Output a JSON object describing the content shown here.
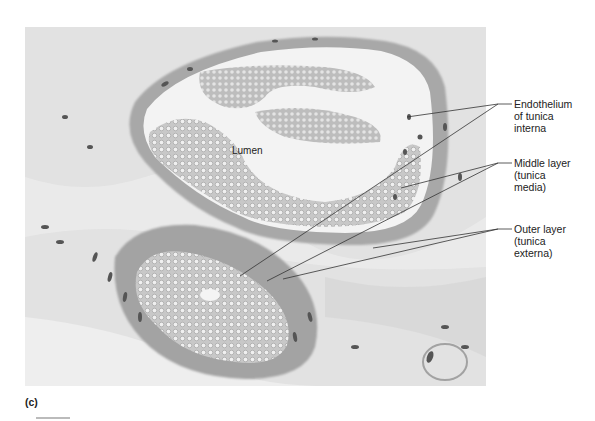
{
  "figure": {
    "panel_letter": "(c)",
    "lumen_label": "Lumen",
    "labels": [
      {
        "id": "endothelium",
        "lines": [
          "Endothelium",
          "of tunica",
          "interna"
        ]
      },
      {
        "id": "middle-layer",
        "lines": [
          "Middle layer",
          "(tunica",
          "media)"
        ]
      },
      {
        "id": "outer-layer",
        "lines": [
          "Outer layer",
          "(tunica",
          "externa)"
        ]
      }
    ],
    "colors": {
      "tissue_background": "#dcdcdc",
      "connective_tissue": "#e6e6e6",
      "vessel_wall": "#a9a9a9",
      "blood_cells": "#c4c4c4",
      "lumen_space": "#f2f2f2",
      "nuclei": "#555555",
      "leader_line": "#333333"
    }
  }
}
